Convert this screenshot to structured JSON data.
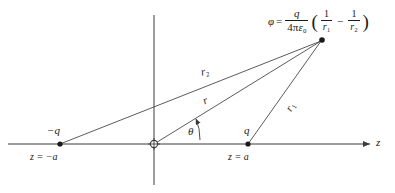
{
  "figure": {
    "background": "#ffffff",
    "line_color": "#3a3a3a",
    "text_color": "#1a1a1a"
  },
  "axes": {
    "z_axis_label": "z",
    "origin_marker": "circle-crosshair",
    "horizontal_axis": {
      "y": 144,
      "x_start": 8,
      "x_end": 372,
      "arrow": "right"
    },
    "vertical_axis": {
      "x": 154,
      "y_top": 15,
      "y_bottom": 185,
      "arrow": "none"
    }
  },
  "charges": [
    {
      "name": "negative-charge",
      "symbol": "−q",
      "position_label_prefix": "z",
      "position_label_eq": "=",
      "position_label_value": "−a",
      "position_label": "z = −a",
      "x": 60,
      "y": 144
    },
    {
      "name": "positive-charge",
      "symbol": "q",
      "position_label_prefix": "z",
      "position_label_eq": "=",
      "position_label_value": "a",
      "position_label": "z = a",
      "x": 248,
      "y": 144
    }
  ],
  "field_point": {
    "x": 322,
    "y": 40,
    "marker": "dot"
  },
  "distances": [
    {
      "name": "r2",
      "base": "r",
      "sub": "2",
      "from": "negative-charge",
      "to": "field-point"
    },
    {
      "name": "r",
      "base": "r",
      "sub": "",
      "from": "origin",
      "to": "field-point"
    },
    {
      "name": "r1",
      "base": "r",
      "sub": "1",
      "from": "positive-charge",
      "to": "field-point"
    }
  ],
  "angle": {
    "name": "theta",
    "symbol": "θ",
    "measured_from": "z-axis",
    "measured_to": "r"
  },
  "formula": {
    "lhs": "φ",
    "equals": "=",
    "prefactor": {
      "numerator": "q",
      "denominator_coeff": "4π",
      "denominator_sym": "ε",
      "denominator_sub": "0"
    },
    "paren_open": "(",
    "term1": {
      "numerator": "1",
      "denominator_base": "r",
      "denominator_sub": "1"
    },
    "operator": "−",
    "term2": {
      "numerator": "1",
      "denominator_base": "r",
      "denominator_sub": "2"
    },
    "paren_close": ")",
    "plain_text": "φ = q/(4πε₀)(1/r₁ − 1/r₂)"
  }
}
